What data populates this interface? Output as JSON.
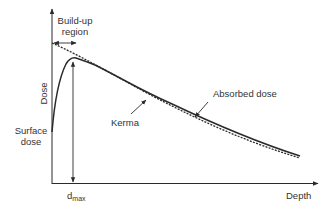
{
  "diagram": {
    "colors": {
      "line": "#2a2a2a",
      "text": "#333333",
      "background": "#ffffff"
    },
    "labels": {
      "buildup_line1": "Build-up",
      "buildup_line2": "region",
      "y_axis": "Dose",
      "x_axis": "Depth",
      "surface_line1": "Surface",
      "surface_line2": "dose",
      "kerma": "Kerma",
      "absorbed_dose": "Absorbed dose",
      "dmax_base": "d",
      "dmax_sub": "max"
    },
    "curves": [
      {
        "name": "Absorbed dose",
        "style": "solid"
      },
      {
        "name": "Kerma",
        "style": "dashed"
      }
    ]
  }
}
